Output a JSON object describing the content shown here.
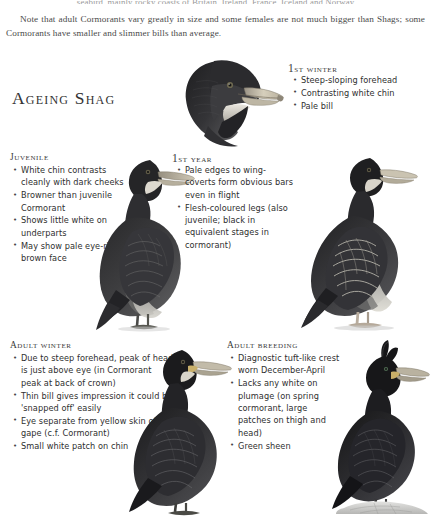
{
  "page": {
    "intro_clipped_line": "seabird, mainly rocky coasts of Britain, Ireland, France, Iceland and Norway",
    "intro_paragraph": "Note that adult Cormorants vary greatly in size and some females are not much bigger than Shags; some Cormorants have smaller and slimmer bills than average.",
    "title": "Ageing Shag"
  },
  "sections": {
    "first_winter": {
      "heading_number": "1",
      "heading_rest": "st winter",
      "bullets": [
        "Steep-sloping forehead",
        "Contrasting white chin",
        "Pale bill"
      ]
    },
    "juvenile": {
      "heading": "Juvenile",
      "bullets": [
        "White chin contrasts cleanly with dark cheeks",
        "Browner than juvenile Cormorant",
        "Shows little white on underparts",
        "May show pale eye-ring in brown face"
      ]
    },
    "first_year": {
      "heading_number": "1",
      "heading_rest": "st year",
      "bullets": [
        "Pale edges to wing-coverts form obvious bars even in flight",
        "Flesh-coloured legs (also juvenile; black in equivalent stages in cormorant)"
      ]
    },
    "adult_winter": {
      "heading": "Adult winter",
      "bullets": [
        "Due to steep forehead, peak of head is just above eye (in Cormorant peak at back of crown)",
        "Thin bill gives impression it could be 'snapped off' easily",
        "Eye separate from yellow skin of gape (c.f. Cormorant)",
        "Small white patch on chin"
      ]
    },
    "adult_breeding": {
      "heading": "Adult breeding",
      "bullets": [
        "Diagnostic tuft-like crest worn December-April",
        "Lacks any white on plumage (on spring cormorant, large patches on thigh and head)",
        "Green sheen"
      ]
    }
  },
  "illustrations": [
    {
      "name": "first-winter-head-portrait",
      "subject": "Shag head in first-winter plumage, pale bill and white chin"
    },
    {
      "name": "juvenile-standing-bird",
      "subject": "Juvenile Shag standing, brown-toned plumage"
    },
    {
      "name": "first-year-standing-bird",
      "subject": "First-year Shag standing, pale-edged wing coverts"
    },
    {
      "name": "adult-winter-standing-bird",
      "subject": "Adult winter Shag standing"
    },
    {
      "name": "adult-breeding-standing-bird",
      "subject": "Adult breeding Shag on rock with forward-curling crest"
    }
  ],
  "colors": {
    "page_background": "#ffffff",
    "text": "#2f2f2f",
    "heading": "#3a3a3a",
    "plumage_dark": "#2a2a2c",
    "plumage_mid": "#4c4c4e",
    "plumage_light": "#8d8d8f",
    "bill_pale": "#cfc7b4",
    "rock": "#cfcfcf"
  }
}
